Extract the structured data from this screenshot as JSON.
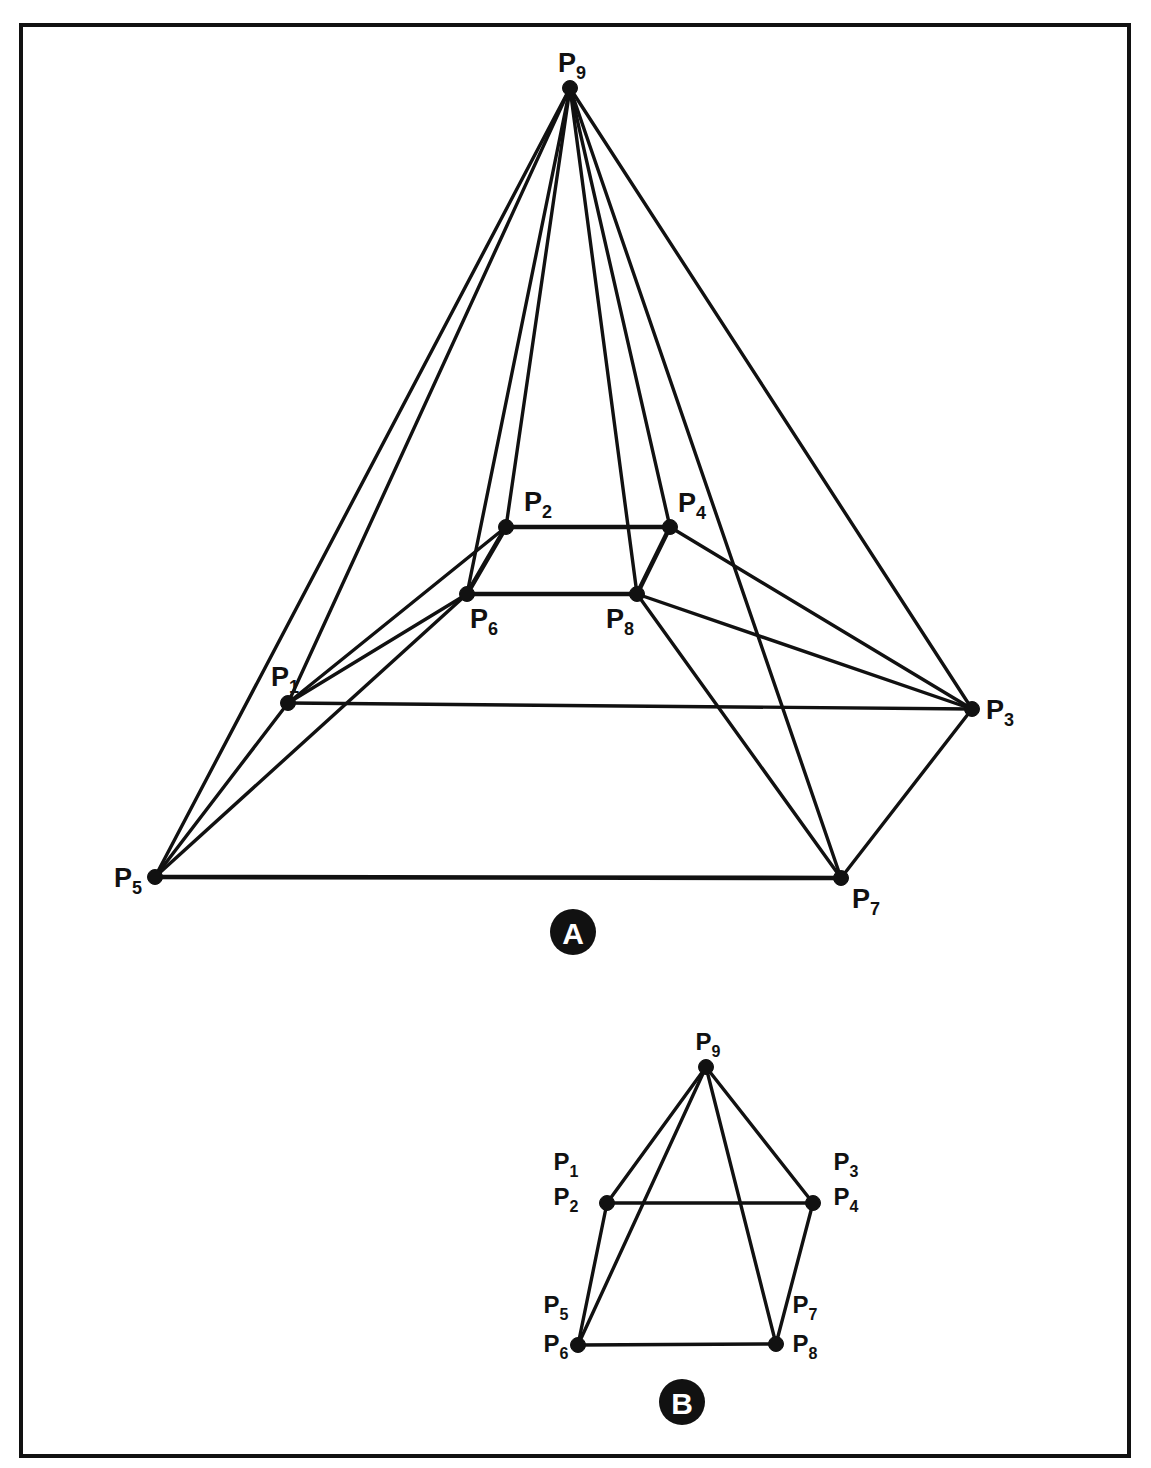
{
  "document": {
    "title": "Pyramid Frustum Vertex Diagram",
    "background_color": "#ffffff",
    "ink_color": "#111111",
    "frame": {
      "x": 21,
      "y": 25,
      "width": 1108,
      "height": 1431,
      "stroke_width": 4
    }
  },
  "figures": [
    {
      "id": "A",
      "badge_label": "A",
      "badge": {
        "cx": 573,
        "cy": 932,
        "r": 23
      },
      "caption": "Perspective view of a truncated pyramid (frustum) with apex node P9",
      "nodes": [
        {
          "name": "P1",
          "label": "P",
          "subscript": "1",
          "x": 288,
          "y": 703,
          "label_x": 285,
          "label_y": 686,
          "label_anchor": "end"
        },
        {
          "name": "P2",
          "label": "P",
          "subscript": "2",
          "x": 506,
          "y": 527,
          "label_x": 538,
          "label_y": 511,
          "label_anchor": "middle"
        },
        {
          "name": "P3",
          "label": "P",
          "subscript": "3",
          "x": 972,
          "y": 709,
          "label_x": 1000,
          "label_y": 719,
          "label_anchor": "start"
        },
        {
          "name": "P4",
          "label": "P",
          "subscript": "4",
          "x": 670,
          "y": 527,
          "label_x": 692,
          "label_y": 512,
          "label_anchor": "middle"
        },
        {
          "name": "P5",
          "label": "P",
          "subscript": "5",
          "x": 155,
          "y": 877,
          "label_x": 128,
          "label_y": 887,
          "label_anchor": "end"
        },
        {
          "name": "P6",
          "label": "P",
          "subscript": "6",
          "x": 467,
          "y": 594,
          "label_x": 484,
          "label_y": 628,
          "label_anchor": "middle"
        },
        {
          "name": "P7",
          "label": "P",
          "subscript": "7",
          "x": 841,
          "y": 878,
          "label_x": 866,
          "label_y": 908,
          "label_anchor": "start"
        },
        {
          "name": "P8",
          "label": "P",
          "subscript": "8",
          "x": 637,
          "y": 594,
          "label_x": 620,
          "label_y": 628,
          "label_anchor": "middle"
        },
        {
          "name": "P9",
          "label": "P",
          "subscript": "9",
          "x": 570,
          "y": 88,
          "label_x": 572,
          "label_y": 72,
          "label_anchor": "middle"
        }
      ],
      "edges": [
        {
          "from": "P9",
          "to": "P1",
          "weight": "normal"
        },
        {
          "from": "P9",
          "to": "P2",
          "weight": "normal"
        },
        {
          "from": "P9",
          "to": "P3",
          "weight": "normal"
        },
        {
          "from": "P9",
          "to": "P4",
          "weight": "normal"
        },
        {
          "from": "P9",
          "to": "P5",
          "weight": "normal"
        },
        {
          "from": "P9",
          "to": "P6",
          "weight": "normal"
        },
        {
          "from": "P9",
          "to": "P7",
          "weight": "normal"
        },
        {
          "from": "P9",
          "to": "P8",
          "weight": "normal"
        },
        {
          "from": "P1",
          "to": "P2",
          "weight": "normal"
        },
        {
          "from": "P1",
          "to": "P3",
          "weight": "normal"
        },
        {
          "from": "P1",
          "to": "P5",
          "weight": "normal"
        },
        {
          "from": "P1",
          "to": "P6",
          "weight": "normal"
        },
        {
          "from": "P2",
          "to": "P4",
          "weight": "thick"
        },
        {
          "from": "P2",
          "to": "P6",
          "weight": "thick"
        },
        {
          "from": "P3",
          "to": "P4",
          "weight": "normal"
        },
        {
          "from": "P3",
          "to": "P7",
          "weight": "normal"
        },
        {
          "from": "P3",
          "to": "P8",
          "weight": "normal"
        },
        {
          "from": "P4",
          "to": "P8",
          "weight": "thick"
        },
        {
          "from": "P5",
          "to": "P6",
          "weight": "normal"
        },
        {
          "from": "P5",
          "to": "P7",
          "weight": "thick"
        },
        {
          "from": "P6",
          "to": "P8",
          "weight": "thick"
        },
        {
          "from": "P7",
          "to": "P8",
          "weight": "normal"
        }
      ]
    },
    {
      "id": "B",
      "badge_label": "B",
      "badge": {
        "cx": 682,
        "cy": 1402,
        "r": 23
      },
      "caption": "Front elevation view of the same frustum with coincident vertex pairs",
      "nodes": [
        {
          "name": "P12",
          "labels": [
            "P1",
            "P2"
          ],
          "x": 607,
          "y": 1203,
          "label_x": 566,
          "label_y": 1170,
          "label2_y": 1205,
          "label_anchor": "middle"
        },
        {
          "name": "P34",
          "labels": [
            "P3",
            "P4"
          ],
          "x": 813,
          "y": 1203,
          "label_x": 846,
          "label_y": 1170,
          "label2_y": 1205,
          "label_anchor": "middle"
        },
        {
          "name": "P56",
          "labels": [
            "P5",
            "P6"
          ],
          "x": 578,
          "y": 1345,
          "label_x": 556,
          "label_y": 1313,
          "label2_y": 1352,
          "label_anchor": "middle"
        },
        {
          "name": "P78",
          "labels": [
            "P7",
            "P8"
          ],
          "x": 776,
          "y": 1344,
          "label_x": 805,
          "label_y": 1313,
          "label2_y": 1352,
          "label_anchor": "middle"
        },
        {
          "name": "P9",
          "labels": [
            "P9"
          ],
          "x": 706,
          "y": 1067,
          "label_x": 708,
          "label_y": 1050,
          "label_anchor": "middle"
        }
      ],
      "edges": [
        {
          "from": "P9",
          "to": "P12",
          "weight": "normal"
        },
        {
          "from": "P9",
          "to": "P34",
          "weight": "normal"
        },
        {
          "from": "P9",
          "to": "P56",
          "weight": "normal"
        },
        {
          "from": "P9",
          "to": "P78",
          "weight": "normal"
        },
        {
          "from": "P12",
          "to": "P34",
          "weight": "normal"
        },
        {
          "from": "P12",
          "to": "P56",
          "weight": "normal"
        },
        {
          "from": "P34",
          "to": "P78",
          "weight": "normal"
        },
        {
          "from": "P56",
          "to": "P78",
          "weight": "normal"
        }
      ]
    }
  ],
  "point_labels": [
    "P1",
    "P2",
    "P3",
    "P4",
    "P5",
    "P6",
    "P7",
    "P8",
    "P9"
  ]
}
